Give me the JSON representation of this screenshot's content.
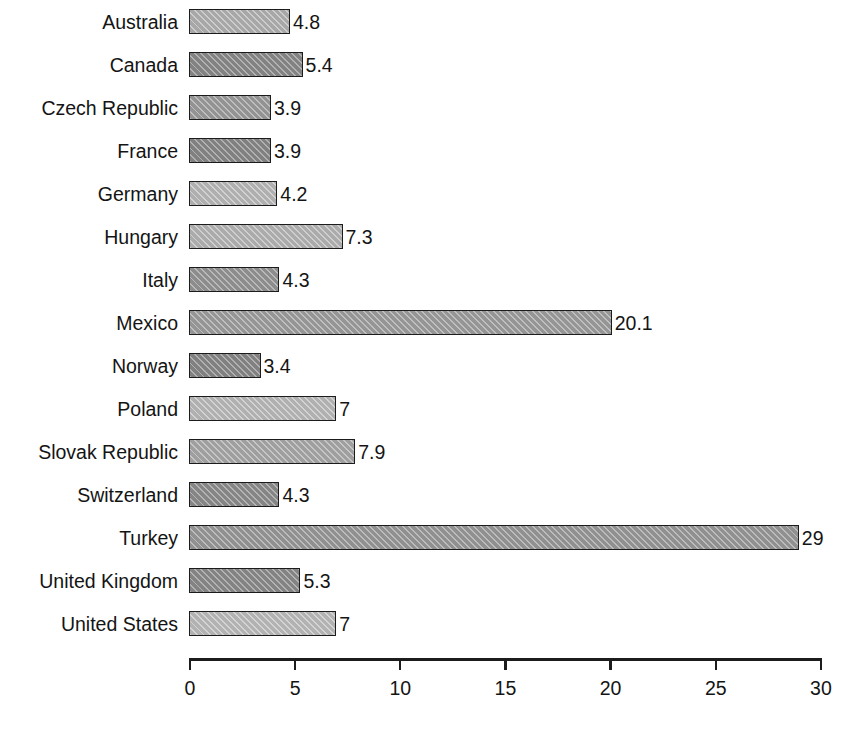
{
  "chart_data": {
    "type": "bar",
    "orientation": "horizontal",
    "title": "",
    "subtitle": "",
    "xlabel": "",
    "ylabel": "",
    "xlim": [
      0,
      30
    ],
    "xticks": [
      0,
      5,
      10,
      15,
      20,
      25,
      30
    ],
    "xtick_labels": [
      "0",
      "5",
      "10",
      "15",
      "20",
      "25",
      "30"
    ],
    "grid": false,
    "legend": "none",
    "categories": [
      "Australia",
      "Canada",
      "Czech Republic",
      "France",
      "Germany",
      "Hungary",
      "Italy",
      "Mexico",
      "Norway",
      "Poland",
      "Slovak Republic",
      "Switzerland",
      "Turkey",
      "United Kingdom",
      "United States"
    ],
    "values": [
      4.8,
      5.4,
      3.9,
      3.9,
      4.2,
      7.3,
      4.3,
      20.1,
      3.4,
      7,
      7.9,
      4.3,
      29,
      5.3,
      7
    ],
    "value_labels": [
      "4.8",
      "5.4",
      "3.9",
      "3.9",
      "4.2",
      "7.3",
      "4.3",
      "20.1",
      "3.4",
      "7",
      "7.9",
      "4.3",
      "29",
      "5.3",
      "7"
    ],
    "bar_fills": [
      "#b4b4b4",
      "#8c8c8c",
      "#9e9e9e",
      "#8a8a8a",
      "#bcbcbc",
      "#b8b8b8",
      "#979797",
      "#a0a0a0",
      "#8a8a8a",
      "#bdbdbd",
      "#ababab",
      "#8f8f8f",
      "#9b9b9b",
      "#8d8d8d",
      "#bfbfbf"
    ],
    "bar_edge_color": "#1c1c1c",
    "text_color": "#141414",
    "background_color": "#ffffff",
    "hatch": "diagonal"
  }
}
